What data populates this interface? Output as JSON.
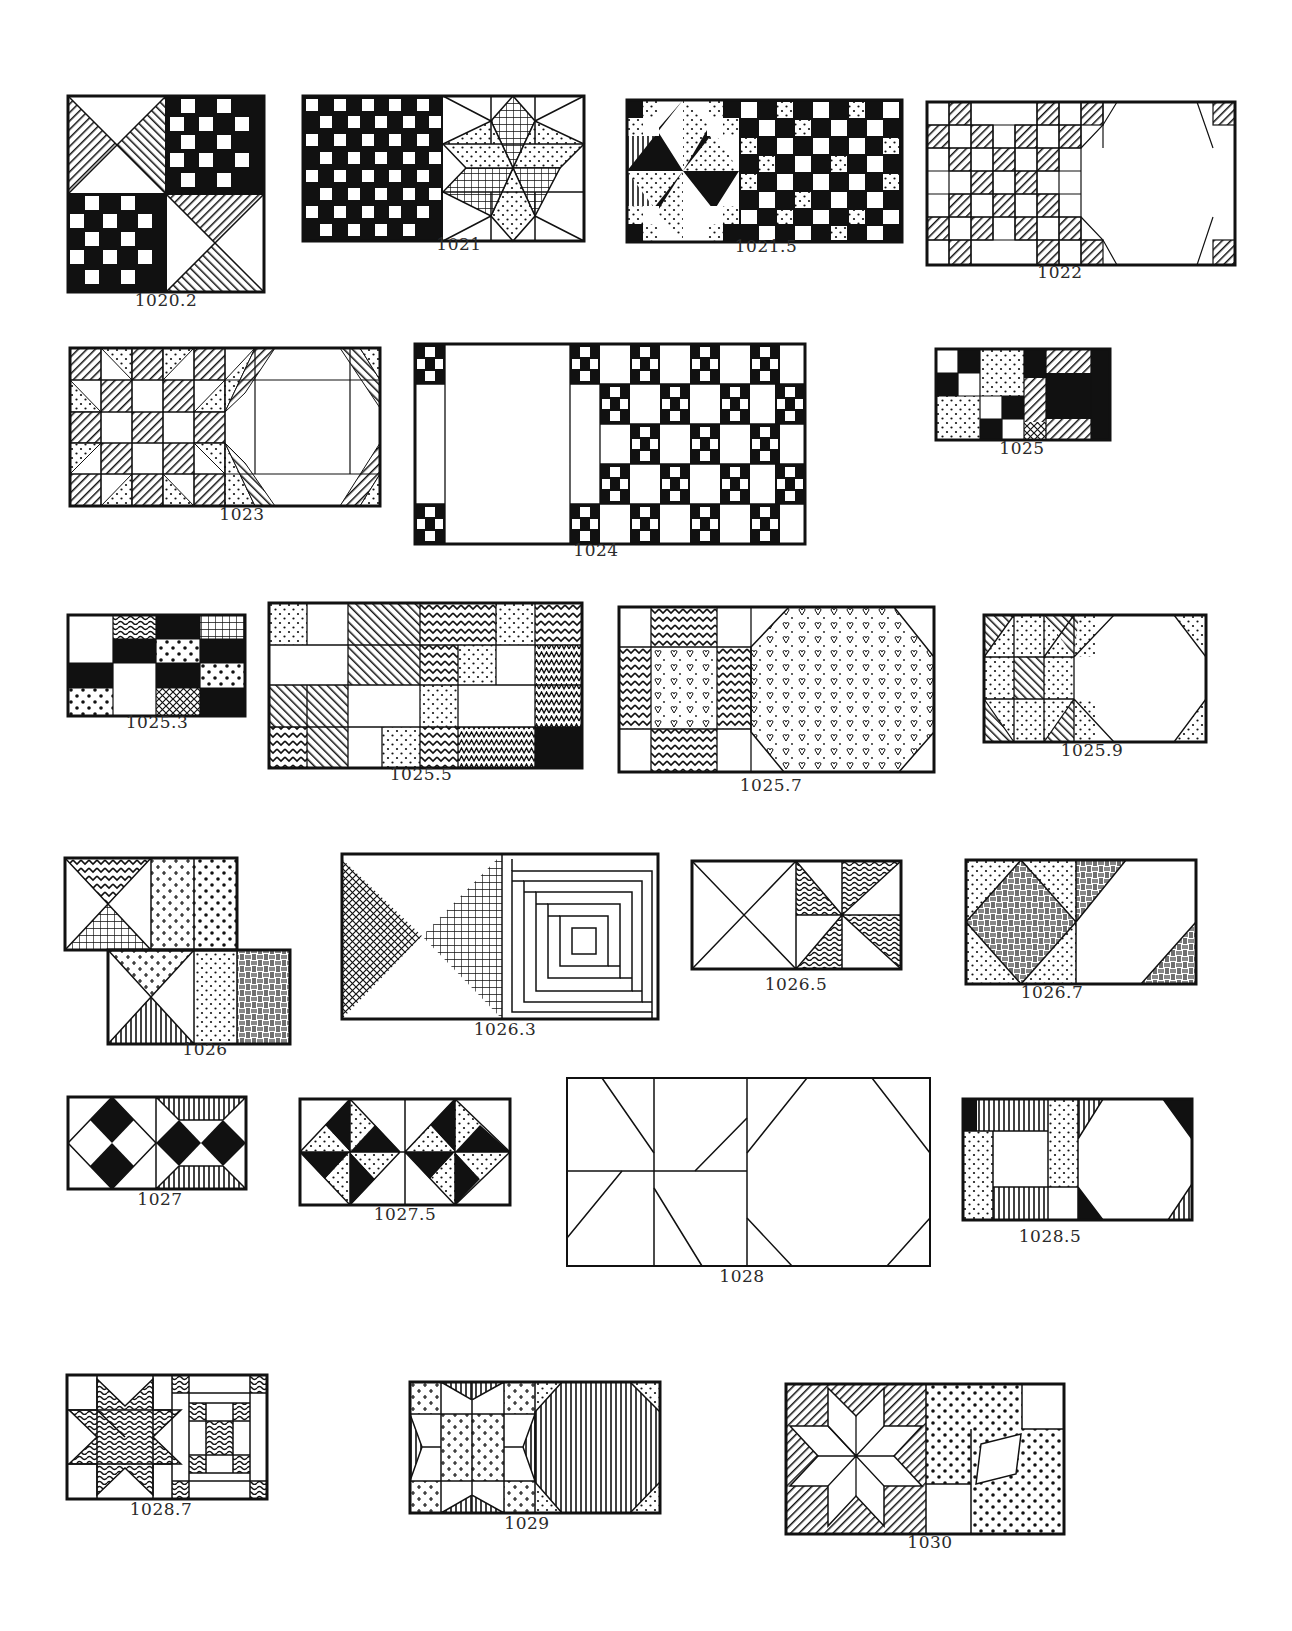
{
  "page": {
    "background": "#ffffff",
    "ink_color": "#1a1a1a"
  },
  "blocks": [
    {
      "id": "1020.2",
      "label": "1020.2",
      "x": 68,
      "y": 96,
      "w": 196,
      "h": 196,
      "label_x": 166,
      "label_y": 298,
      "kind": "hourglass-checker"
    },
    {
      "id": "1021",
      "label": "1021",
      "x": 303,
      "y": 96,
      "w": 281,
      "h": 145,
      "label_x": 459,
      "label_y": 243,
      "kind": "checker-lemoyne-star"
    },
    {
      "id": "1021.5",
      "label": "1021.5",
      "x": 627,
      "y": 100,
      "w": 275,
      "h": 142,
      "label_x": 766,
      "label_y": 244,
      "kind": "star-checker"
    },
    {
      "id": "1022",
      "label": "1022",
      "x": 927,
      "y": 102,
      "w": 308,
      "h": 163,
      "label_x": 1060,
      "label_y": 270,
      "kind": "irish-chain-snowball"
    },
    {
      "id": "1023",
      "label": "1023",
      "x": 70,
      "y": 348,
      "w": 310,
      "h": 158,
      "label_x": 242,
      "label_y": 512,
      "kind": "shoo-fly-snowball"
    },
    {
      "id": "1024",
      "label": "1024",
      "x": 415,
      "y": 344,
      "w": 390,
      "h": 200,
      "label_x": 596,
      "label_y": 548,
      "kind": "sashing-nine-patch"
    },
    {
      "id": "1025",
      "label": "1025",
      "x": 936,
      "y": 349,
      "w": 174,
      "h": 91,
      "label_x": 1022,
      "label_y": 446,
      "kind": "patchwork"
    },
    {
      "id": "1025.3",
      "label": "1025.3",
      "x": 68,
      "y": 615,
      "w": 177,
      "h": 101,
      "label_x": 157,
      "label_y": 720,
      "kind": "four-patch-prints"
    },
    {
      "id": "1025.5",
      "label": "1025.5",
      "x": 269,
      "y": 603,
      "w": 313,
      "h": 165,
      "label_x": 421,
      "label_y": 772,
      "kind": "strip-patchwork"
    },
    {
      "id": "1025.7",
      "label": "1025.7",
      "x": 619,
      "y": 607,
      "w": 315,
      "h": 165,
      "label_x": 771,
      "label_y": 783,
      "kind": "nine-patch-octagon"
    },
    {
      "id": "1025.9",
      "label": "1025.9",
      "x": 984,
      "y": 615,
      "w": 222,
      "h": 127,
      "label_x": 1092,
      "label_y": 748,
      "kind": "shoo-fly-octagon"
    },
    {
      "id": "1026",
      "label": "1026",
      "x": 65,
      "y": 858,
      "w": 225,
      "h": 186,
      "label_x": 205,
      "label_y": 1047,
      "kind": "hourglass-offset"
    },
    {
      "id": "1026.3",
      "label": "1026.3",
      "x": 342,
      "y": 854,
      "w": 316,
      "h": 165,
      "label_x": 505,
      "label_y": 1027,
      "kind": "bowtie-log-cabin"
    },
    {
      "id": "1026.5",
      "label": "1026.5",
      "x": 692,
      "y": 861,
      "w": 209,
      "h": 108,
      "label_x": 796,
      "label_y": 982,
      "kind": "x-pinwheel"
    },
    {
      "id": "1026.7",
      "label": "1026.7",
      "x": 966,
      "y": 860,
      "w": 230,
      "h": 124,
      "label_x": 1052,
      "label_y": 990,
      "kind": "square-in-square"
    },
    {
      "id": "1027",
      "label": "1027",
      "x": 68,
      "y": 1097,
      "w": 178,
      "h": 92,
      "label_x": 160,
      "label_y": 1197,
      "kind": "diamonds"
    },
    {
      "id": "1027.5",
      "label": "1027.5",
      "x": 300,
      "y": 1099,
      "w": 210,
      "h": 106,
      "label_x": 405,
      "label_y": 1212,
      "kind": "pinwheel-triangles"
    },
    {
      "id": "1028",
      "label": "1028",
      "x": 567,
      "y": 1078,
      "w": 363,
      "h": 188,
      "label_x": 742,
      "label_y": 1274,
      "kind": "outline-snowball"
    },
    {
      "id": "1028.5",
      "label": "1028.5",
      "x": 963,
      "y": 1099,
      "w": 229,
      "h": 121,
      "label_x": 1050,
      "label_y": 1234,
      "kind": "frame-octagon"
    },
    {
      "id": "1028.7",
      "label": "1028.7",
      "x": 67,
      "y": 1375,
      "w": 200,
      "h": 124,
      "label_x": 161,
      "label_y": 1507,
      "kind": "star-nine-patch"
    },
    {
      "id": "1029",
      "label": "1029",
      "x": 410,
      "y": 1382,
      "w": 250,
      "h": 131,
      "label_x": 527,
      "label_y": 1521,
      "kind": "sawtooth-snowball"
    },
    {
      "id": "1030",
      "label": "1030",
      "x": 786,
      "y": 1384,
      "w": 278,
      "h": 150,
      "label_x": 930,
      "label_y": 1540,
      "kind": "lemoyne-star-patch"
    }
  ]
}
